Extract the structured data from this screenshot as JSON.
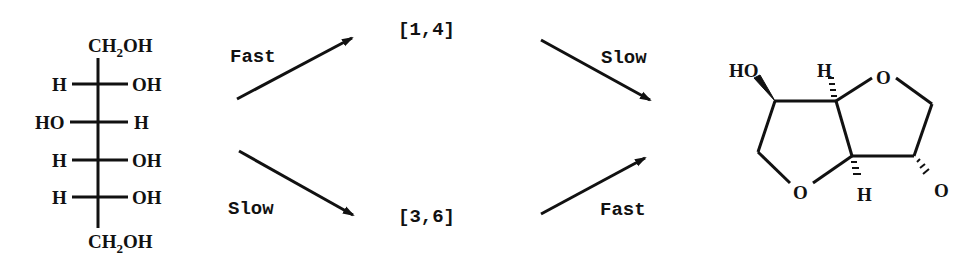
{
  "fischer": {
    "top": {
      "left": "CH",
      "sub": "2",
      "right": "OH"
    },
    "rows": [
      {
        "left": "H",
        "right": "OH"
      },
      {
        "left": "HO",
        "right": "H"
      },
      {
        "left": "H",
        "right": "OH"
      },
      {
        "left": "H",
        "right": "OH"
      }
    ],
    "bottom": {
      "left": "CH",
      "sub": "2",
      "right": "OH"
    }
  },
  "pathways": {
    "upper_first": "Fast",
    "lower_first": "Slow",
    "intermediate_upper": "[1,4]",
    "intermediate_lower": "[3,6]",
    "upper_second": "Slow",
    "lower_second": "Fast"
  },
  "product": {
    "ho": "HO",
    "h_top": "H",
    "h_bottom": "H",
    "o_ring_top": "O",
    "o_ring_bottom": "O",
    "o_substituent": "O"
  }
}
